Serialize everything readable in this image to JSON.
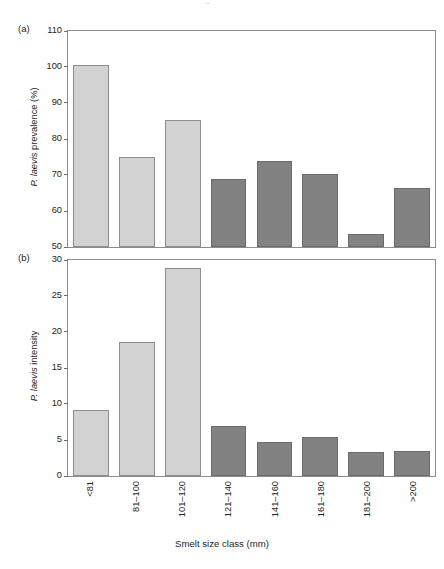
{
  "figure": {
    "top_artifact": "··",
    "xaxis_title": "Smelt size class (mm)",
    "bar_colors": {
      "light": "#d2d2d2",
      "dark": "#828282",
      "light_border": "#8e8e8e",
      "dark_border": "#6b6b6b",
      "axis": "#8d8d8d"
    }
  },
  "panels": [
    {
      "tag": "(a)",
      "ylabel_prefix": "P. laevis",
      "ylabel_suffix": " prevalence (%)",
      "yticks": [
        110,
        100,
        90,
        80,
        70,
        60,
        50
      ]
    },
    {
      "tag": "(b)",
      "ylabel_prefix": "P. laevis",
      "ylabel_suffix": " intensity",
      "yticks": [
        30,
        25,
        20,
        15,
        10,
        5,
        0
      ]
    }
  ],
  "chart_data": [
    {
      "type": "bar",
      "panel": "(a)",
      "title": "",
      "xlabel": "Smelt size class (mm)",
      "ylabel": "P. laevis prevalence (%)",
      "categories": [
        "<81",
        "81–100",
        "101–120",
        "121–140",
        "141–160",
        "161–180",
        "181–200",
        ">200"
      ],
      "values": [
        100.2,
        74.8,
        85.1,
        68.6,
        73.6,
        69.9,
        53.4,
        66.1
      ],
      "bar_group": [
        "light",
        "light",
        "light",
        "dark",
        "dark",
        "dark",
        "dark",
        "dark"
      ],
      "ylim": [
        50,
        110
      ],
      "ytick_step": 10,
      "grid": false,
      "legend": "none"
    },
    {
      "type": "bar",
      "panel": "(b)",
      "title": "",
      "xlabel": "Smelt size class (mm)",
      "ylabel": "P. laevis intensity",
      "categories": [
        "<81",
        "81–100",
        "101–120",
        "121–140",
        "141–160",
        "161–180",
        "181–200",
        ">200"
      ],
      "values": [
        9.0,
        18.5,
        28.7,
        6.8,
        4.6,
        5.3,
        3.2,
        3.3
      ],
      "bar_group": [
        "light",
        "light",
        "light",
        "dark",
        "dark",
        "dark",
        "dark",
        "dark"
      ],
      "ylim": [
        0,
        30
      ],
      "ytick_step": 5,
      "grid": false,
      "legend": "none"
    }
  ]
}
